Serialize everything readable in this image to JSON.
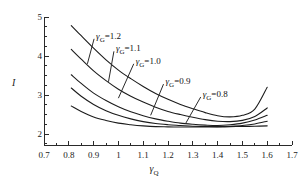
{
  "chart_data": {
    "type": "line",
    "title": "",
    "xlabel": "γQ",
    "ylabel": "I",
    "xlim": [
      0.7,
      1.7
    ],
    "ylim": [
      1.72,
      5.0
    ],
    "grid": false,
    "legend_position": "inline-annotations",
    "xticks": [
      "0.7",
      "0.8",
      "0.9",
      "1",
      "1.1",
      "1.2",
      "1.3",
      "1.4",
      "1.5",
      "1.6",
      "1.7"
    ],
    "xtick_values": [
      0.7,
      0.8,
      0.9,
      1.0,
      1.1,
      1.2,
      1.3,
      1.4,
      1.5,
      1.6,
      1.7
    ],
    "xminor_values": [
      0.75,
      0.85,
      0.95,
      1.05,
      1.15,
      1.25,
      1.35,
      1.45,
      1.55,
      1.65
    ],
    "yticks": [
      "2",
      "3",
      "4",
      "5"
    ],
    "ytick_values": [
      2,
      3,
      4,
      5
    ],
    "yminor_values": [
      1.75,
      2.25,
      2.5,
      2.75,
      3.25,
      3.5,
      3.75,
      4.25,
      4.5,
      4.75
    ],
    "x": [
      0.81,
      0.85,
      0.9,
      0.95,
      1.0,
      1.05,
      1.1,
      1.15,
      1.2,
      1.25,
      1.3,
      1.35,
      1.4,
      1.45,
      1.5,
      1.55,
      1.6
    ],
    "series": [
      {
        "name": "γG=0.8",
        "label": "γG=0.8",
        "gamma_g": 0.8,
        "values": [
          2.72,
          2.58,
          2.44,
          2.35,
          2.28,
          2.24,
          2.21,
          2.19,
          2.185,
          2.18,
          2.18,
          2.18,
          2.18,
          2.19,
          2.195,
          2.2,
          2.21
        ]
      },
      {
        "name": "γG=0.9",
        "label": "γG=0.9",
        "gamma_g": 0.9,
        "values": [
          3.18,
          2.97,
          2.76,
          2.6,
          2.48,
          2.39,
          2.32,
          2.27,
          2.24,
          2.22,
          2.2,
          2.195,
          2.19,
          2.2,
          2.22,
          2.26,
          2.33
        ]
      },
      {
        "name": "γG=1.0",
        "label": "γG=1.0",
        "gamma_g": 1.0,
        "values": [
          3.52,
          3.3,
          3.05,
          2.86,
          2.7,
          2.57,
          2.47,
          2.39,
          2.33,
          2.28,
          2.25,
          2.23,
          2.22,
          2.24,
          2.28,
          2.36,
          2.48
        ]
      },
      {
        "name": "γG=1.1",
        "label": "γG=1.1",
        "gamma_g": 1.1,
        "values": [
          4.17,
          3.92,
          3.62,
          3.37,
          3.15,
          2.97,
          2.82,
          2.69,
          2.58,
          2.5,
          2.43,
          2.37,
          2.33,
          2.32,
          2.35,
          2.45,
          2.67
        ]
      },
      {
        "name": "γG=1.2",
        "label": "γG=1.2",
        "gamma_g": 1.2,
        "values": [
          4.78,
          4.52,
          4.2,
          3.9,
          3.64,
          3.42,
          3.22,
          3.04,
          2.89,
          2.76,
          2.65,
          2.55,
          2.47,
          2.44,
          2.48,
          2.64,
          3.2
        ]
      }
    ],
    "annotations": [
      {
        "text": "γG=1.2",
        "x": 0.91,
        "y": 4.62,
        "leader_to": {
          "x": 0.875,
          "y": 3.8
        }
      },
      {
        "text": "γG=1.1",
        "x": 0.99,
        "y": 4.3,
        "leader_to": {
          "x": 0.96,
          "y": 3.34
        }
      },
      {
        "text": "γG=1.0",
        "x": 1.07,
        "y": 3.98,
        "leader_to": {
          "x": 1.0,
          "y": 2.92
        }
      },
      {
        "text": "γG=0.9",
        "x": 1.19,
        "y": 3.46,
        "leader_to": {
          "x": 1.13,
          "y": 2.48
        }
      },
      {
        "text": "γG=0.8",
        "x": 1.34,
        "y": 3.13,
        "leader_to": {
          "x": 1.27,
          "y": 2.26
        }
      }
    ]
  }
}
